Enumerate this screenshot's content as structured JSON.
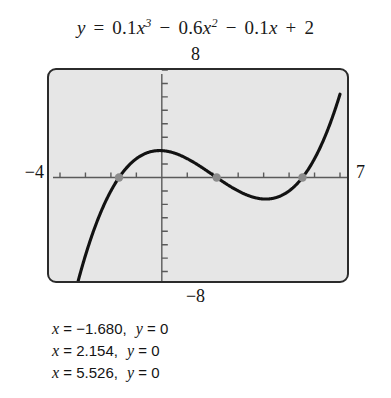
{
  "equation": {
    "lhs": "y",
    "eq": "=",
    "term1_coef": "0.1",
    "term1_var": "x",
    "term1_exp": "3",
    "op1": "−",
    "term2_coef": "0.6",
    "term2_var": "x",
    "term2_exp": "2",
    "op2": "−",
    "term3_coef": "0.1",
    "term3_var": "x",
    "op3": "+",
    "term4": "2",
    "full_text": "y = 0.1x³ − 0.6x² − 0.1x + 2"
  },
  "axis_labels": {
    "ymax": "8",
    "ymin": "−8",
    "xmin": "−4",
    "xmax": "7"
  },
  "solutions": [
    {
      "x_sym": "x",
      "x_eq": "=",
      "x_val": "−1.680,",
      "y_sym": "y",
      "y_eq": "=",
      "y_val": "0"
    },
    {
      "x_sym": "x",
      "x_eq": "=",
      "x_val": "2.154,",
      "y_sym": "y",
      "y_eq": "=",
      "y_val": "0"
    },
    {
      "x_sym": "x",
      "x_eq": "=",
      "x_val": "5.526,",
      "y_sym": "y",
      "y_eq": "=",
      "y_val": "0"
    }
  ],
  "colors": {
    "screen_background": "#e6e6e6",
    "screen_border": "#2b2b2b",
    "curve": "#121212",
    "axis": "#5a5a5a",
    "root_marker": "#8c8c8c",
    "text": "#141414"
  },
  "chart_data": {
    "type": "line",
    "xlabel": "",
    "ylabel": "",
    "xlim": [
      -4,
      7
    ],
    "ylim": [
      -8,
      8
    ],
    "grid": false,
    "legend": "none",
    "xticks": [
      -4,
      -3,
      -2,
      -1,
      0,
      1,
      2,
      3,
      4,
      5,
      6,
      7
    ],
    "yticks": [
      -8,
      -7,
      -6,
      -5,
      -4,
      -3,
      -2,
      -1,
      0,
      1,
      2,
      3,
      4,
      5,
      6,
      7,
      8
    ],
    "xtick_labels": [
      "−4",
      "",
      "",
      "",
      "",
      "",
      "",
      "",
      "",
      "",
      "",
      "7"
    ],
    "ytick_labels": [
      "−8",
      "",
      "",
      "",
      "",
      "",
      "",
      "",
      "",
      "",
      "",
      "",
      "",
      "",
      "",
      "",
      "8"
    ],
    "series": [
      {
        "name": "y = 0.1x^3 - 0.6x^2 - 0.1x + 2",
        "equation_coeffs": {
          "x3": 0.1,
          "x2": -0.6,
          "x1": -0.1,
          "x0": 2
        },
        "x": [
          -4.0,
          -3.75,
          -3.5,
          -3.25,
          -3.0,
          -2.75,
          -2.5,
          -2.25,
          -2.0,
          -1.75,
          -1.5,
          -1.25,
          -1.0,
          -0.75,
          -0.5,
          -0.25,
          0.0,
          0.25,
          0.5,
          0.75,
          1.0,
          1.25,
          1.5,
          1.75,
          2.0,
          2.25,
          2.5,
          2.75,
          3.0,
          3.25,
          3.5,
          3.75,
          4.0,
          4.25,
          4.5,
          4.75,
          5.0,
          5.25,
          5.5,
          5.75,
          6.0,
          6.25,
          6.5,
          6.75,
          7.0
        ],
        "y": [
          -14.4,
          -12.52,
          -10.78,
          -9.18,
          -7.72,
          -6.39,
          -5.19,
          -4.11,
          -3.16,
          -2.32,
          -1.6,
          -0.98,
          -0.47,
          -0.05,
          0.28,
          0.54,
          2.0,
          1.94,
          1.81,
          1.63,
          1.4,
          1.13,
          0.84,
          0.52,
          0.2,
          -0.12,
          -0.44,
          -0.74,
          -1.03,
          -1.29,
          -1.52,
          -1.71,
          -1.86,
          -1.95,
          -1.99,
          -1.97,
          -1.88,
          -1.71,
          -1.47,
          -1.15,
          -0.73,
          -0.23,
          0.38,
          1.09,
          1.92
        ]
      }
    ],
    "markers": [
      {
        "label": "root-1",
        "x": -1.68,
        "y": 0
      },
      {
        "label": "root-2",
        "x": 2.154,
        "y": 0
      },
      {
        "label": "root-3",
        "x": 5.526,
        "y": 0
      }
    ],
    "annotations": [
      "x = −1.680,  y = 0",
      "x = 2.154,  y = 0",
      "x = 5.526,  y = 0"
    ]
  }
}
